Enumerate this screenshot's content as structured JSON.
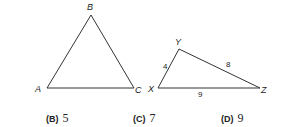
{
  "triangles": [
    {
      "name": "ABC",
      "vertices": [
        {
          "label": "A",
          "x": 47,
          "y": 88,
          "lx": 35,
          "ly": 92
        },
        {
          "label": "B",
          "x": 91,
          "y": 15,
          "lx": 87,
          "ly": 10
        },
        {
          "label": "C",
          "x": 134,
          "y": 88,
          "lx": 135,
          "ly": 93
        }
      ],
      "side_labels": []
    },
    {
      "name": "XYZ",
      "vertices": [
        {
          "label": "X",
          "x": 158,
          "y": 88,
          "lx": 148,
          "ly": 92
        },
        {
          "label": "Y",
          "x": 179,
          "y": 49,
          "lx": 175,
          "ly": 45
        },
        {
          "label": "Z",
          "x": 260,
          "y": 88,
          "lx": 261,
          "ly": 93
        }
      ],
      "side_labels": [
        {
          "text": "4",
          "x": 163,
          "y": 69
        },
        {
          "text": "8",
          "x": 226,
          "y": 67
        },
        {
          "text": "9",
          "x": 198,
          "y": 97
        }
      ]
    }
  ],
  "choices": [
    {
      "letter": "(B)",
      "value": "5",
      "x": 46
    },
    {
      "letter": "(C)",
      "value": "7",
      "x": 133
    },
    {
      "letter": "(D)",
      "value": "9",
      "x": 221
    }
  ]
}
